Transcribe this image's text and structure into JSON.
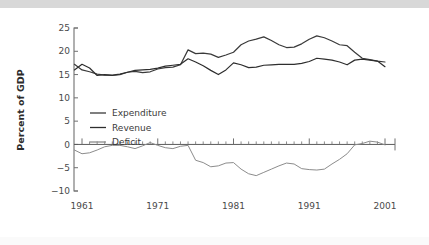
{
  "figure": {
    "background_color": "#ffffff",
    "top_band_color": "#d8d8d8",
    "axis_color": "#707070"
  },
  "chart_data": {
    "type": "line",
    "title": "",
    "subtitle": "",
    "xlabel": "",
    "ylabel": "Percent of GDP",
    "xlim": [
      1960,
      2002
    ],
    "ylim": [
      -10,
      25
    ],
    "xticks": [
      1961,
      1971,
      1981,
      1991,
      2001
    ],
    "xtick_labels": [
      "1961",
      "1971",
      "1981",
      "1991",
      "2001"
    ],
    "yticks": [
      -10,
      -5,
      0,
      5,
      10,
      15,
      20,
      25
    ],
    "ytick_labels": [
      "−10",
      "−5",
      "0",
      "5",
      "10",
      "15",
      "20",
      "25"
    ],
    "grid": false,
    "minor_xticks_every": 1,
    "zero_reference_line": true,
    "legend_position": "center-left",
    "x": [
      1960,
      1961,
      1962,
      1963,
      1964,
      1965,
      1966,
      1967,
      1968,
      1969,
      1970,
      1971,
      1972,
      1973,
      1974,
      1975,
      1976,
      1977,
      1978,
      1979,
      1980,
      1981,
      1982,
      1983,
      1984,
      1985,
      1986,
      1987,
      1988,
      1989,
      1990,
      1991,
      1992,
      1993,
      1994,
      1995,
      1996,
      1997,
      1998,
      1999,
      2000,
      2001
    ],
    "series": [
      {
        "name": "Expenditure",
        "color": "#3a3a3a",
        "width": 1.2,
        "values": [
          17.2,
          16.0,
          15.6,
          15.1,
          14.9,
          14.8,
          15.0,
          15.5,
          15.7,
          15.4,
          15.6,
          16.2,
          16.5,
          16.6,
          17.1,
          20.3,
          19.5,
          19.6,
          19.4,
          18.7,
          19.2,
          19.8,
          21.4,
          22.2,
          22.6,
          23.1,
          22.3,
          21.4,
          20.8,
          20.9,
          21.6,
          22.6,
          23.3,
          22.9,
          22.2,
          21.4,
          21.2,
          19.8,
          18.5,
          18.2,
          17.9,
          17.7
        ]
      },
      {
        "name": "Revenue",
        "color": "#2e2e2e",
        "width": 1.2,
        "values": [
          16.0,
          17.2,
          16.4,
          14.8,
          15.0,
          14.9,
          15.1,
          15.5,
          15.9,
          16.0,
          16.1,
          16.4,
          16.8,
          17.0,
          17.2,
          18.4,
          17.7,
          16.9,
          15.9,
          15.0,
          16.0,
          17.5,
          17.1,
          16.5,
          16.6,
          17.0,
          17.1,
          17.2,
          17.2,
          17.2,
          17.4,
          17.8,
          18.5,
          18.3,
          18.1,
          17.7,
          17.1,
          18.1,
          18.3,
          18.1,
          17.9,
          16.7
        ]
      },
      {
        "name": "Deficit",
        "color": "#8c8c8c",
        "width": 1.0,
        "values": [
          -1.2,
          -2.0,
          -1.8,
          -1.2,
          -0.5,
          -0.2,
          -0.2,
          -0.5,
          -0.9,
          -0.3,
          0.4,
          -0.2,
          -0.7,
          -0.9,
          -0.4,
          -0.2,
          -3.4,
          -3.9,
          -4.8,
          -4.6,
          -4.0,
          -3.9,
          -5.3,
          -6.3,
          -6.7,
          -6.0,
          -5.3,
          -4.6,
          -4.0,
          -4.2,
          -5.2,
          -5.4,
          -5.5,
          -5.3,
          -4.2,
          -3.2,
          -2.0,
          -0.1,
          0.2,
          0.7,
          0.5,
          -0.1
        ]
      }
    ]
  },
  "legend": {
    "entries": [
      {
        "label": "Expenditure",
        "color": "#3a3a3a"
      },
      {
        "label": "Revenue",
        "color": "#2e2e2e"
      },
      {
        "label": "Deficit",
        "color": "#8c8c8c"
      }
    ]
  },
  "caption_ghost": ""
}
